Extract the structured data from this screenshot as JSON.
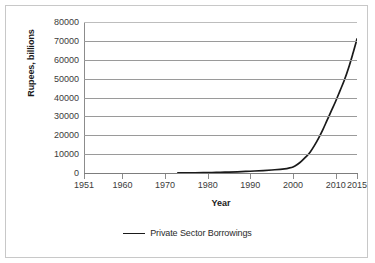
{
  "chart_data": {
    "type": "line",
    "title": "",
    "xlabel": "Year",
    "ylabel": "Rupees, billions",
    "xlim": [
      1951,
      2015
    ],
    "ylim": [
      0,
      80000
    ],
    "grid": true,
    "legend_position": "bottom",
    "y_ticks": [
      80000,
      70000,
      60000,
      50000,
      40000,
      30000,
      20000,
      10000,
      0
    ],
    "y_tick_labels": [
      "80000",
      "70000",
      "60000",
      "50000",
      "40000",
      "30000",
      "20000",
      "10000",
      "0"
    ],
    "x_ticks": [
      1951,
      1960,
      1970,
      1980,
      1990,
      2000,
      2010,
      2015
    ],
    "x_tick_labels": [
      "1951",
      "1960",
      "1970",
      "1980",
      "1990",
      "2000",
      "2010",
      "2015"
    ],
    "series": [
      {
        "name": "Private Sector Borrowings",
        "color": "#1a1a1a",
        "x": [
          1973,
          1975,
          1977,
          1979,
          1981,
          1983,
          1985,
          1987,
          1989,
          1991,
          1993,
          1995,
          1997,
          1998,
          1999,
          2000,
          2001,
          2002,
          2003,
          2004,
          2005,
          2006,
          2007,
          2008,
          2009,
          2010,
          2011,
          2012,
          2013,
          2014,
          2015
        ],
        "values": [
          60,
          90,
          130,
          190,
          260,
          360,
          480,
          640,
          830,
          1050,
          1300,
          1600,
          1950,
          2200,
          2600,
          3200,
          4500,
          6300,
          8500,
          11000,
          14500,
          18500,
          23000,
          28000,
          33000,
          38000,
          43500,
          49000,
          55500,
          63000,
          71000
        ]
      }
    ]
  },
  "legend": {
    "entries": [
      {
        "label": "Private Sector Borrowings",
        "color": "#1a1a1a"
      }
    ]
  }
}
